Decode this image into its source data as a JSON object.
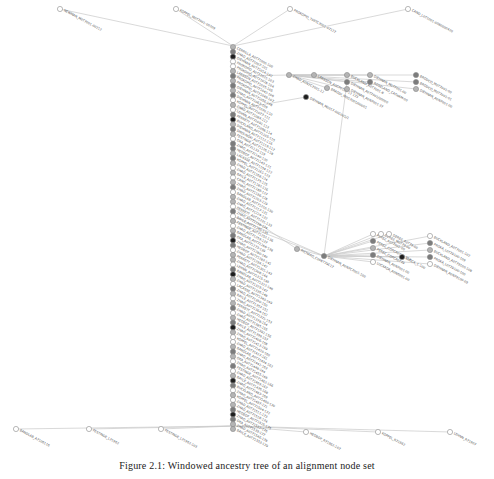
{
  "figure": {
    "caption_label": "Figure 2.1:",
    "caption_text": "Windowed ancestry tree of an alignment node set",
    "colors": {
      "edge": "#c8c8c8",
      "node_white": "#ffffff",
      "node_light": "#b4b4b4",
      "node_mid": "#7c7c7c",
      "node_dark": "#1e1e1e",
      "node_stroke": "#8a8a8a",
      "label": "#555555"
    },
    "spine": {
      "x": 233,
      "y_start": 47,
      "y_end": 429,
      "count": 80,
      "shade_pattern": [
        "light",
        "mid",
        "dark",
        "white",
        "white",
        "light",
        "mid",
        "light",
        "mid",
        "light",
        "mid",
        "white",
        "light",
        "white",
        "mid",
        "dark",
        "light",
        "mid",
        "light",
        "white",
        "mid",
        "mid",
        "light",
        "mid",
        "light",
        "white",
        "light",
        "white",
        "light",
        "mid",
        "white",
        "light",
        "light",
        "white",
        "mid",
        "white",
        "light",
        "white",
        "light",
        "mid",
        "dark",
        "mid",
        "white",
        "light",
        "light",
        "white",
        "mid",
        "dark",
        "light",
        "white",
        "mid",
        "light",
        "white",
        "light",
        "mid",
        "white",
        "light",
        "mid",
        "dark",
        "light",
        "white",
        "white",
        "light",
        "mid",
        "light",
        "white",
        "mid",
        "white",
        "light",
        "dark",
        "mid",
        "white",
        "light",
        "white",
        "light",
        "mid",
        "dark",
        "mid",
        "light",
        "light"
      ],
      "label_prefix": [
        "CERRILLA",
        "ZHAO",
        "DIEHNAN",
        "PROKOPIO",
        "PROKOPIO",
        "LARSSON",
        "PROKOPIO",
        "PROKOPIO",
        "DIEHNAN",
        "ZHAO",
        "DIEHNAN",
        "KOPPEL",
        "ZHAO",
        "LEHNN",
        "PERRETT",
        "BUCKLAND",
        "DIEHNAN",
        "SMOLINSKI",
        "FESTINGE",
        "OKA",
        "ZHAO",
        "HEDBOF",
        "LACASSE",
        "KOPPEL",
        "ZHAO",
        "ZHAO",
        "BAYLE",
        "CANO",
        "ZHAO",
        "ZHAO",
        "BANDLAB",
        "ZHAO",
        "ZHAO",
        "PERRETT",
        "ZHAO",
        "BAYLE",
        "FESTINGE",
        "ZHAO",
        "BANDLAB",
        "OKA",
        "ZHAO",
        "HEDBOF",
        "ZHAO",
        "PERRETT",
        "ZHAO",
        "LEHNN",
        "BANDLAB",
        "ZHAO",
        "ZHAO",
        "LACASSE",
        "ZHAO",
        "BAYLE",
        "ZHAO",
        "PERRETT",
        "ZHAO",
        "ZHAO",
        "HEDBOF",
        "BAYLE",
        "ZHAO",
        "ZHAO",
        "KOPPEL",
        "ZHAO",
        "BANDLAB",
        "ZHAO",
        "OKA",
        "ZHAO",
        "FESTINGE",
        "ZHAO",
        "BAYLE",
        "ZHAO",
        "BUCKLAND",
        "ZHAO",
        "KOPPEL",
        "ZHAO",
        "ZHAO",
        "HEDBOF",
        "ZHAO",
        "OKA",
        "ZHAO",
        "BAYLE"
      ]
    },
    "top_branch": [
      {
        "x": 60,
        "y": 9,
        "shade": "white",
        "label": "NEWMAN_M0T7001-00212"
      },
      {
        "x": 176,
        "y": 9,
        "shade": "white",
        "label": "KOPPEL_M0T7001-00209"
      },
      {
        "x": 290,
        "y": 9,
        "shade": "white",
        "label": "PROKOPIO_T09TC7001-07127"
      },
      {
        "x": 408,
        "y": 9,
        "shade": "white",
        "label": "CANO_L0T1001-0080000420"
      }
    ],
    "bottom_branch": [
      {
        "x": 16,
        "y": 429,
        "shade": "white",
        "label": "BANDLAB_A7106116"
      },
      {
        "x": 89,
        "y": 429,
        "shade": "white",
        "label": "FESTINGE_L71962"
      },
      {
        "x": 161,
        "y": 429,
        "shade": "white",
        "label": "FESTINGE_L71962-103"
      },
      {
        "x": 306,
        "y": 432,
        "shade": "white",
        "label": "HEDBOF_R71962-107"
      },
      {
        "x": 378,
        "y": 432,
        "shade": "white",
        "label": "KOPPEL_R71962"
      },
      {
        "x": 450,
        "y": 432,
        "shade": "white",
        "label": "LEHNN_R71907"
      }
    ],
    "upper_cluster": {
      "hub": {
        "x": 289,
        "y": 75,
        "shade": "light",
        "label": "ZHAO_A0N7C7001-12"
      },
      "dark_node": {
        "x": 306,
        "y": 97,
        "shade": "dark",
        "label": "DIEHNAN_M0017-00C001/1"
      },
      "nodes": [
        {
          "x": 314,
          "y": 75,
          "shade": "light",
          "label": "LARSSON_A0CF0101-12 173"
        },
        {
          "x": 327,
          "y": 88,
          "shade": "light",
          "label": "BRAODI_M0G7001/00001"
        },
        {
          "x": 347,
          "y": 75,
          "shade": "light",
          "label": "BUCKLAND_A0T7001-8"
        },
        {
          "x": 347,
          "y": 82,
          "shade": "mid",
          "label": "DIEHNAN_A0T7001/00000"
        },
        {
          "x": 347,
          "y": 89,
          "shade": "light",
          "label": "DIEHNAN_A0N7001-37"
        },
        {
          "x": 370,
          "y": 75,
          "shade": "light",
          "label": "DIEHNAN_M0T7001-00"
        },
        {
          "x": 370,
          "y": 82,
          "shade": "mid",
          "label": "ROSELAND_CATHAM-00"
        },
        {
          "x": 416,
          "y": 75,
          "shade": "mid",
          "label": "BRODCO_M0T7001-00"
        },
        {
          "x": 416,
          "y": 82,
          "shade": "mid",
          "label": "BRODCO_M0T7001-01"
        },
        {
          "x": 416,
          "y": 89,
          "shade": "light",
          "label": "DIEHNAN_A0N7001-00"
        }
      ]
    },
    "middle_cluster": {
      "hub_a": {
        "x": 297,
        "y": 249,
        "shade": "light",
        "label": "RICHARD_C008T79C17"
      },
      "hub_b": {
        "x": 324,
        "y": 256,
        "shade": "mid",
        "label": "DIEHNAN_A0N7C7001-100"
      },
      "nodes": [
        {
          "x": 373,
          "y": 234,
          "shade": "white",
          "label": "PEREZ_A0T7001-00"
        },
        {
          "x": 381,
          "y": 234,
          "shade": "white",
          "label": "DEREZ_M0T79-00"
        },
        {
          "x": 389,
          "y": 234,
          "shade": "white",
          "label": "DEREZ_A0T79-00"
        },
        {
          "x": 373,
          "y": 241,
          "shade": "mid",
          "label": "PEREZ_COPCA0T79-114"
        },
        {
          "x": 373,
          "y": 248,
          "shade": "light",
          "label": "PEREZ_COPCA0T79"
        },
        {
          "x": 373,
          "y": 255,
          "shade": "mid",
          "label": "DIEHNAN_A0N7001-00"
        },
        {
          "x": 373,
          "y": 262,
          "shade": "white",
          "label": "LUCKADA_A0N6001-00"
        },
        {
          "x": 402,
          "y": 257,
          "shade": "dark",
          "label": "BLOCK_1-100"
        },
        {
          "x": 430,
          "y": 236,
          "shade": "white",
          "label": "BUCKLAND_A0T7001-102"
        },
        {
          "x": 430,
          "y": 243,
          "shade": "mid",
          "label": "PROKA_L0T79100-109"
        },
        {
          "x": 430,
          "y": 250,
          "shade": "light",
          "label": "BUCKLAND_A0T79100-108"
        },
        {
          "x": 430,
          "y": 257,
          "shade": "mid",
          "label": "PROKA_L0T79100-100"
        },
        {
          "x": 430,
          "y": 264,
          "shade": "white",
          "label": "DIEHNAN_A0N79100-09"
        }
      ]
    }
  }
}
